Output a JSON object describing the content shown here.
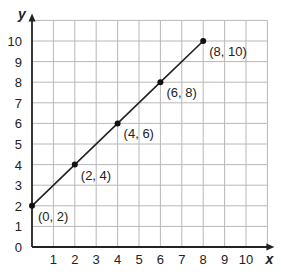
{
  "chart_data": {
    "type": "line",
    "title": "",
    "xlabel": "x",
    "ylabel": "y",
    "xlim": [
      0,
      11
    ],
    "ylim": [
      0,
      11
    ],
    "grid": true,
    "x_ticks": [
      "1",
      "2",
      "3",
      "4",
      "5",
      "6",
      "7",
      "8",
      "9",
      "10"
    ],
    "y_ticks": [
      "0",
      "1",
      "2",
      "3",
      "4",
      "5",
      "6",
      "7",
      "8",
      "9",
      "10"
    ],
    "series": [
      {
        "name": "line",
        "x": [
          0,
          2,
          4,
          6,
          8
        ],
        "y": [
          2,
          4,
          6,
          8,
          10
        ]
      }
    ],
    "points": [
      {
        "x": 0,
        "y": 2,
        "label": "(0, 2)"
      },
      {
        "x": 2,
        "y": 4,
        "label": "(2, 4)"
      },
      {
        "x": 4,
        "y": 6,
        "label": "(4, 6)"
      },
      {
        "x": 6,
        "y": 8,
        "label": "(6, 8)"
      },
      {
        "x": 8,
        "y": 10,
        "label": "(8, 10)"
      }
    ],
    "colors": {
      "line": "#222222",
      "grid": "#b8b8b8",
      "axis": "#222222"
    }
  }
}
